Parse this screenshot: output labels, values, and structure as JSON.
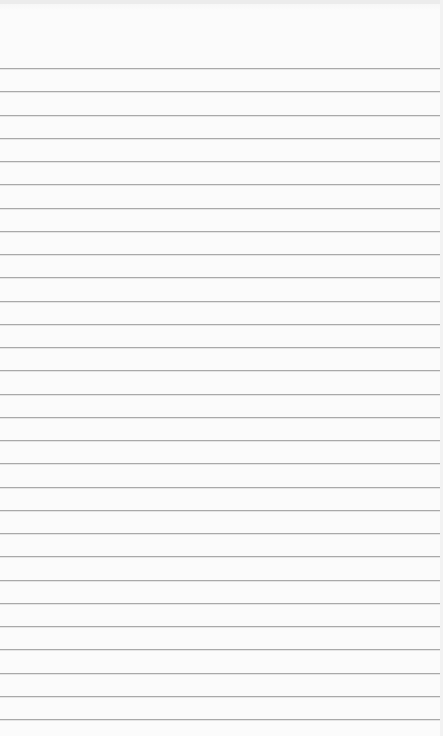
{
  "page": {
    "type": "lined-notepad",
    "background_color": "#fbfbfb",
    "rule_color": "#a9a9a9",
    "first_rule_y": 68,
    "rule_spacing": 23.25,
    "rule_count": 29,
    "text_lines": []
  }
}
